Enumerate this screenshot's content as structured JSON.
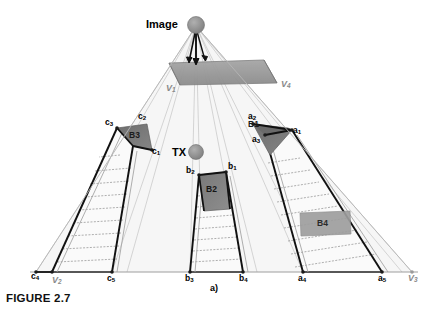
{
  "figure": {
    "caption": "FIGURE 2.7",
    "subfigure_label": "a)",
    "title": "Image",
    "tx_label": "TX"
  },
  "nodes": {
    "image_source": "Image",
    "transmitter": "TX"
  },
  "blocks": [
    {
      "id": "B3",
      "label": "B3"
    },
    {
      "id": "B2",
      "label": "B2"
    },
    {
      "id": "B1",
      "label": "B1"
    },
    {
      "id": "B4",
      "label": "B4"
    }
  ],
  "vertex_labels": {
    "a1": {
      "base": "a",
      "sub": "1"
    },
    "a2": {
      "base": "a",
      "sub": "2"
    },
    "a3": {
      "base": "a",
      "sub": "3"
    },
    "a4": {
      "base": "a",
      "sub": "4"
    },
    "a5": {
      "base": "a",
      "sub": "5"
    },
    "b1": {
      "base": "b",
      "sub": "1"
    },
    "b2": {
      "base": "b",
      "sub": "2"
    },
    "b3": {
      "base": "b",
      "sub": "3"
    },
    "b4": {
      "base": "b",
      "sub": "4"
    },
    "c1": {
      "base": "c",
      "sub": "1"
    },
    "c2": {
      "base": "c",
      "sub": "2"
    },
    "c3": {
      "base": "c",
      "sub": "3"
    },
    "c4": {
      "base": "c",
      "sub": "4"
    },
    "c5": {
      "base": "c",
      "sub": "5"
    }
  },
  "view_labels": {
    "v1": {
      "base": "V",
      "sub": "1"
    },
    "v2": {
      "base": "V",
      "sub": "2"
    },
    "v3": {
      "base": "V",
      "sub": "3"
    },
    "v4": {
      "base": "V",
      "sub": "4"
    }
  },
  "colors": {
    "background": "#ffffff",
    "stroke_dark": "#111111",
    "stroke_light": "#a8a8a8",
    "stroke_ray": "#bdbdbd",
    "node_fill": "#8f8f8f",
    "plane_fill": "#9a9a9a",
    "block_dark": "#6f6f6f",
    "block_mid": "#7c7c7c",
    "block_light": "#9c9c9c",
    "region_fill": "#f4f4f4",
    "ground_line": "#9c9c9c"
  }
}
